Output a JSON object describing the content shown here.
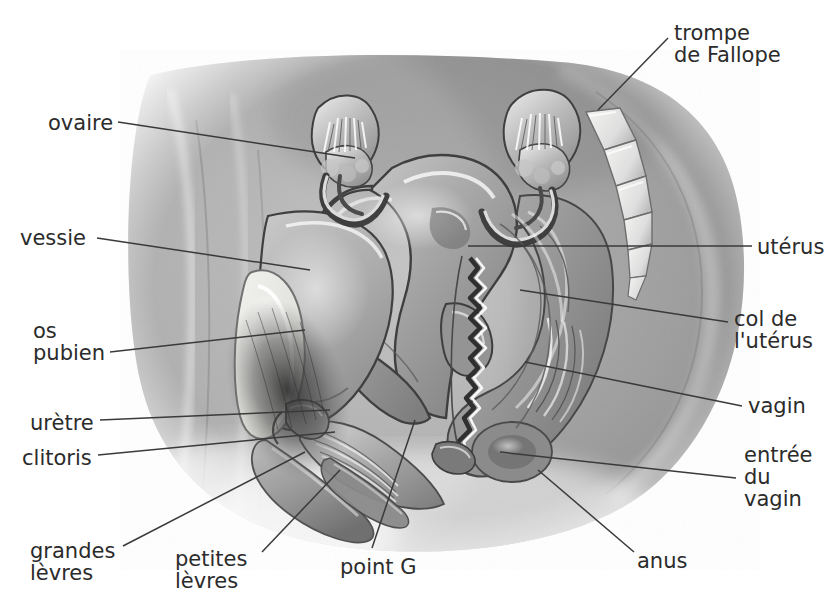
{
  "figure": {
    "kind": "anatomical-diagram",
    "language": "fr",
    "style": "grayscale airbrush medical illustration",
    "colors": {
      "background": "#ffffff",
      "ink": "#2b2b2b",
      "leader_line": "#3a3a3a",
      "skin_mid": "#9a9a9a",
      "skin_light": "#cfcfcf",
      "organ_mid": "#8e8e8e",
      "bone_light": "#e8e8e6",
      "shadow_dark": "#3c3c3c"
    }
  },
  "labels": [
    {
      "id": "trompe-de-fallope",
      "lines": [
        "trompe",
        "de Fallope"
      ],
      "side": "right",
      "x": 674,
      "y": 22
    },
    {
      "id": "ovaire",
      "lines": [
        "ovaire"
      ],
      "side": "left",
      "x": 48,
      "y": 112
    },
    {
      "id": "vessie",
      "lines": [
        "vessie"
      ],
      "side": "left",
      "x": 20,
      "y": 227
    },
    {
      "id": "uterus",
      "lines": [
        "utérus"
      ],
      "side": "right",
      "x": 757,
      "y": 236
    },
    {
      "id": "col-de-l-uterus",
      "lines": [
        "col de",
        "l'utérus"
      ],
      "side": "right",
      "x": 734,
      "y": 308
    },
    {
      "id": "os-pubien",
      "lines": [
        "os",
        "pubien"
      ],
      "side": "left",
      "x": 33,
      "y": 320
    },
    {
      "id": "vagin",
      "lines": [
        "vagin"
      ],
      "side": "right",
      "x": 748,
      "y": 395
    },
    {
      "id": "uretre",
      "lines": [
        "urètre"
      ],
      "side": "left",
      "x": 30,
      "y": 412
    },
    {
      "id": "clitoris",
      "lines": [
        "clitoris"
      ],
      "side": "left",
      "x": 22,
      "y": 447
    },
    {
      "id": "entree-du-vagin",
      "lines": [
        "entrée",
        "du",
        "vagin"
      ],
      "side": "right",
      "x": 744,
      "y": 444
    },
    {
      "id": "grandes-levres",
      "lines": [
        "grandes",
        "lèvres"
      ],
      "side": "left",
      "x": 30,
      "y": 540
    },
    {
      "id": "petites-levres",
      "lines": [
        "petites",
        "lèvres"
      ],
      "side": "left",
      "x": 175,
      "y": 548
    },
    {
      "id": "point-g",
      "lines": [
        "point G"
      ],
      "side": "bottom",
      "x": 340,
      "y": 556
    },
    {
      "id": "anus",
      "lines": [
        "anus"
      ],
      "side": "right",
      "x": 637,
      "y": 550
    }
  ],
  "leaders": [
    {
      "id": "leader-ovaire",
      "points": "118,122 355,158"
    },
    {
      "id": "leader-vessie",
      "points": "97,238 310,270"
    },
    {
      "id": "leader-trompe",
      "points": "668,38 598,110"
    },
    {
      "id": "leader-uterus",
      "points": "752,246 468,246"
    },
    {
      "id": "leader-col",
      "points": "728,322 520,290"
    },
    {
      "id": "leader-os-pubien",
      "points": "110,352 305,330"
    },
    {
      "id": "leader-vagin",
      "points": "742,406 525,362"
    },
    {
      "id": "leader-uretre",
      "points": "100,420 330,410"
    },
    {
      "id": "leader-clitoris",
      "points": "98,455 335,432"
    },
    {
      "id": "leader-entree-vagin",
      "points": "736,478 500,452"
    },
    {
      "id": "leader-grandes-levres",
      "points": "123,546 305,452"
    },
    {
      "id": "leader-petites-levres",
      "points": "262,552 340,470"
    },
    {
      "id": "leader-point-g",
      "points": "372,548 415,420"
    },
    {
      "id": "leader-anus",
      "points": "634,552 538,470"
    }
  ]
}
